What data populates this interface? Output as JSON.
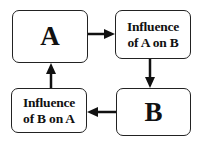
{
  "diagram": {
    "nodes": [
      {
        "id": "A",
        "label": "A"
      },
      {
        "id": "influence-a-on-b",
        "label_line1": "Influence",
        "label_line2": "of A on B"
      },
      {
        "id": "B",
        "label": "B"
      },
      {
        "id": "influence-b-on-a",
        "label_line1": "Influence",
        "label_line2": "of B on A"
      }
    ],
    "edges": [
      {
        "from": "A",
        "to": "influence-a-on-b"
      },
      {
        "from": "influence-a-on-b",
        "to": "B"
      },
      {
        "from": "B",
        "to": "influence-b-on-a"
      },
      {
        "from": "influence-b-on-a",
        "to": "A"
      }
    ]
  }
}
